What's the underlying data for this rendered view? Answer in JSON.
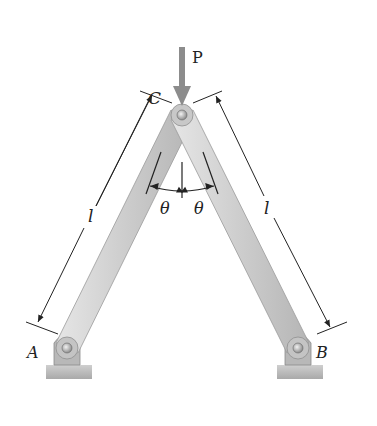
{
  "figure": {
    "labels": {
      "load": "P",
      "apex": "C",
      "left_support": "A",
      "right_support": "B",
      "length_left": "l",
      "length_right": "l",
      "angle_left": "θ",
      "angle_right": "θ"
    },
    "colors": {
      "bar": "#cfcfcf",
      "bar_edge": "#9a9a9a",
      "arrow": "#8c8c8c",
      "ground": "#bdbdbd",
      "ink": "#222222"
    }
  }
}
